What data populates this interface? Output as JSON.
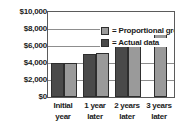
{
  "chart_data": {
    "type": "bar",
    "title": "",
    "subtitle": "",
    "xlabel": "",
    "ylabel": "",
    "grid": true,
    "legend_position": "inside-top-left",
    "ylim": [
      0,
      10000
    ],
    "ytick_labels": [
      "$10,000",
      "$8,000",
      "$6,000",
      "$4,000",
      "$2,000",
      "$0"
    ],
    "ytick_values": [
      10000,
      8000,
      6000,
      4000,
      2000,
      0
    ],
    "categories": [
      "Initial year",
      "1 year later",
      "2 years later",
      "3 years later"
    ],
    "category_lines": [
      [
        "Initial",
        "year"
      ],
      [
        "1 year",
        "later"
      ],
      [
        "2 years",
        "later"
      ],
      [
        "3 years",
        "later"
      ]
    ],
    "series": [
      {
        "name": "= Actual data",
        "legend_label": "= Actual data",
        "key": "actual",
        "color": "#4a4a4a",
        "values": [
          4000,
          5000,
          6500,
          null
        ]
      },
      {
        "name": "= Proportional growth model",
        "legend_label": "= Proportional growth model",
        "key": "model",
        "color": "#9a9a9a",
        "values": [
          4000,
          5150,
          6550,
          8250
        ]
      }
    ]
  },
  "legend": {
    "rows": [
      {
        "label": "= Proportional growth model",
        "swatch": "model"
      },
      {
        "label": "= Actual data",
        "swatch": "actual"
      }
    ]
  },
  "colors": {
    "actual": "#4a4a4a",
    "model": "#9a9a9a",
    "axis": "#5b5b5b",
    "grid": "#8d8d8d",
    "text": "#1b1b1b",
    "background": "#ffffff"
  }
}
